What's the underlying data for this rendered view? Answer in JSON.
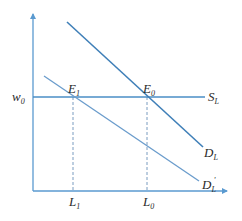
{
  "diagram": {
    "type": "labor market supply/demand",
    "colors": {
      "line": "#4a8ec6",
      "axis": "#5a9ad0",
      "dashed": "#7a9cc0",
      "text": "#2a2a2a"
    },
    "axes": {
      "y_axis": {
        "x": 33,
        "y_top": 13,
        "y_bottom": 191
      },
      "x_axis": {
        "y": 191,
        "x_left": 33,
        "x_right": 228
      }
    },
    "labels": {
      "wage": {
        "main": "w",
        "sub": "0"
      },
      "supply": {
        "main": "S",
        "sub": "L"
      },
      "demand": {
        "main": "D",
        "sub": "L"
      },
      "demand_shifted": {
        "main": "D",
        "sub": "L",
        "prime": "'"
      },
      "e1": {
        "main": "E",
        "sub": "1"
      },
      "e0": {
        "main": "E",
        "sub": "0"
      },
      "l1": {
        "main": "L",
        "sub": "1"
      },
      "l0": {
        "main": "L",
        "sub": "0"
      }
    },
    "lines": {
      "supply_SL": {
        "x1": 33,
        "y1": 97,
        "x2": 205,
        "y2": 97
      },
      "demand_DL": {
        "x1": 67,
        "y1": 22,
        "x2": 203,
        "y2": 147
      },
      "demand_DL_prime": {
        "x1": 44,
        "y1": 76,
        "x2": 199,
        "y2": 181
      },
      "dashed_L1": {
        "x1": 73,
        "y1": 97,
        "x2": 73,
        "y2": 191
      },
      "dashed_L0": {
        "x1": 147,
        "y1": 97,
        "x2": 147,
        "y2": 191
      }
    }
  }
}
